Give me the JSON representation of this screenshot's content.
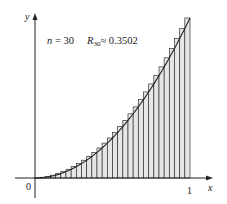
{
  "chart_data": {
    "type": "bar",
    "title": "",
    "annotation": {
      "n_label": "n = 30",
      "r_label": "R",
      "r_sub": "30",
      "r_value": "≈ 0.3502"
    },
    "function": "y = x^2",
    "method": "right endpoint Riemann sum",
    "n": 30,
    "xlabel": "x",
    "ylabel": "y",
    "xlim": [
      0,
      1
    ],
    "ylim": [
      0,
      1
    ],
    "x_ticks": [
      "0",
      "1"
    ],
    "grid": false,
    "legend": null,
    "categories": [
      "1/30",
      "2/30",
      "3/30",
      "4/30",
      "5/30",
      "6/30",
      "7/30",
      "8/30",
      "9/30",
      "10/30",
      "11/30",
      "12/30",
      "13/30",
      "14/30",
      "15/30",
      "16/30",
      "17/30",
      "18/30",
      "19/30",
      "20/30",
      "21/30",
      "22/30",
      "23/30",
      "24/30",
      "25/30",
      "26/30",
      "27/30",
      "28/30",
      "29/30",
      "30/30"
    ],
    "values": [
      0.0011,
      0.0044,
      0.01,
      0.0178,
      0.0278,
      0.04,
      0.0544,
      0.0711,
      0.09,
      0.1111,
      0.1344,
      0.16,
      0.1878,
      0.2178,
      0.25,
      0.2844,
      0.3211,
      0.36,
      0.4011,
      0.4444,
      0.49,
      0.5378,
      0.5878,
      0.64,
      0.6944,
      0.7511,
      0.81,
      0.8711,
      0.9344,
      1.0
    ],
    "result": 0.3502
  },
  "labels": {
    "origin": "0",
    "x_one": "1",
    "x_axis": "x",
    "y_axis": "y",
    "n_text": "n = 30",
    "r_main": "R",
    "r_sub": "30",
    "r_value": "≈ 0.3502"
  },
  "colors": {
    "bar_fill": "#e6e6e6",
    "bar_stroke": "#333333",
    "curve": "#222222",
    "axis": "#222222"
  }
}
